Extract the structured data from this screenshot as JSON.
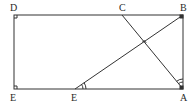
{
  "diagram": {
    "type": "geometry",
    "stroke_color": "#333333",
    "points": {
      "D": {
        "label": "D",
        "x": 14,
        "y": 15
      },
      "C": {
        "label": "C",
        "x": 122,
        "y": 15
      },
      "B": {
        "label": "B",
        "x": 183,
        "y": 15
      },
      "E_left": {
        "label": "E",
        "x": 14,
        "y": 89
      },
      "E_mid": {
        "label": "E",
        "x": 75,
        "y": 89
      },
      "A": {
        "label": "A",
        "x": 183,
        "y": 89
      },
      "P": {
        "label": "",
        "x": 144,
        "y": 44
      }
    },
    "segments": [
      [
        "D",
        "B"
      ],
      [
        "B",
        "A"
      ],
      [
        "A",
        "E_left"
      ],
      [
        "E_left",
        "D"
      ],
      [
        "C",
        "A"
      ],
      [
        "E_mid",
        "B"
      ]
    ],
    "right_angle_marks": [
      "D",
      "E_left",
      "B",
      "A",
      "P"
    ],
    "angle_marks": [
      {
        "at": "E_mid",
        "arcs": 2
      },
      {
        "at": "A",
        "arcs": 2,
        "between": "AB and AC"
      }
    ],
    "labels": {
      "D": "D",
      "C": "C",
      "B": "B",
      "E_left": "E",
      "E_mid": "E",
      "A": "A"
    }
  }
}
